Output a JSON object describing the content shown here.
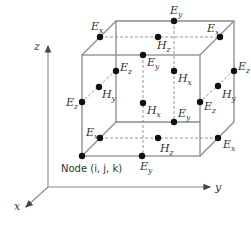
{
  "figure": {
    "node_label": "Node (i, j, k)",
    "axes": {
      "x": "x",
      "y": "y",
      "z": "z"
    },
    "colors": {
      "line": "#8a8a8a",
      "dot": "#111111",
      "text": "#333333"
    },
    "components": [
      {
        "id": "ex-top-left",
        "label": "E",
        "sub": "x"
      },
      {
        "id": "ey-top-back",
        "label": "E",
        "sub": "y"
      },
      {
        "id": "ex-top-right",
        "label": "E",
        "sub": "x"
      },
      {
        "id": "hz-top",
        "label": "H",
        "sub": "z"
      },
      {
        "id": "ey-top-front",
        "label": "E",
        "sub": "y"
      },
      {
        "id": "ez-back-left",
        "label": "E",
        "sub": "z"
      },
      {
        "id": "hy-left",
        "label": "H",
        "sub": "y"
      },
      {
        "id": "ez-front-left",
        "label": "E",
        "sub": "z"
      },
      {
        "id": "hx-front",
        "label": "H",
        "sub": "x"
      },
      {
        "id": "hx-back",
        "label": "H",
        "sub": "x"
      },
      {
        "id": "ez-back-right",
        "label": "E",
        "sub": "z"
      },
      {
        "id": "hy-right",
        "label": "H",
        "sub": "y"
      },
      {
        "id": "ez-front-right",
        "label": "E",
        "sub": "z"
      },
      {
        "id": "ey-bottom-back",
        "label": "E",
        "sub": "y"
      },
      {
        "id": "ex-bottom-left",
        "label": "E",
        "sub": "x"
      },
      {
        "id": "hz-bottom",
        "label": "H",
        "sub": "z"
      },
      {
        "id": "ex-bottom-right",
        "label": "E",
        "sub": "x"
      },
      {
        "id": "ey-bottom-front",
        "label": "E",
        "sub": "y"
      }
    ]
  }
}
